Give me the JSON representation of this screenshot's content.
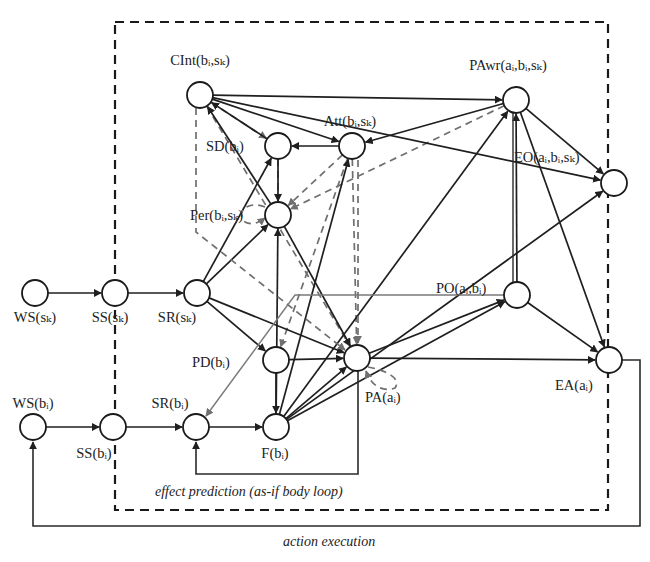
{
  "colors": {
    "edge_solid": "#1f1f1f",
    "edge_dashed": "#6f6f6f",
    "node_fill": "#ffffff",
    "node_stroke": "#1a1a1a",
    "background": "#ffffff"
  },
  "boundary": {
    "x": 115,
    "y": 22,
    "width": 493,
    "height": 488
  },
  "node_radius": 13,
  "nodes": [
    {
      "id": "WSs",
      "label": "WS(sₖ)",
      "x": 35,
      "y": 293,
      "lx": 35,
      "ly": 322,
      "anchor": "middle"
    },
    {
      "id": "SSs",
      "label": "SS(sₖ)",
      "x": 115,
      "y": 293,
      "lx": 110,
      "ly": 322,
      "anchor": "middle"
    },
    {
      "id": "SRs",
      "label": "SR(sₖ)",
      "x": 197,
      "y": 293,
      "lx": 177,
      "ly": 322,
      "anchor": "middle"
    },
    {
      "id": "CInt",
      "label": "CInt(bᵢ,sₖ)",
      "x": 200,
      "y": 95,
      "lx": 200,
      "ly": 65,
      "anchor": "middle"
    },
    {
      "id": "SD",
      "label": "SD(bᵢ)",
      "x": 278,
      "y": 146,
      "lx": 206,
      "ly": 151,
      "anchor": "start"
    },
    {
      "id": "Att",
      "label": "Att(bᵢ,sₖ)",
      "x": 352,
      "y": 146,
      "lx": 350,
      "ly": 126,
      "anchor": "middle"
    },
    {
      "id": "Per",
      "label": "Per(bᵢ,sₖ)",
      "x": 278,
      "y": 215,
      "lx": 190,
      "ly": 220,
      "anchor": "start"
    },
    {
      "id": "PAwr",
      "label": "PAwr(aᵢ,bᵢ,sₖ)",
      "x": 516,
      "y": 100,
      "lx": 508,
      "ly": 70,
      "anchor": "middle"
    },
    {
      "id": "EO",
      "label": "EO(aᵢ,bᵢ,sₖ)",
      "x": 614,
      "y": 183,
      "lx": 514,
      "ly": 162,
      "anchor": "start"
    },
    {
      "id": "PO",
      "label": "PO(aᵢ,bᵢ)",
      "x": 517,
      "y": 295,
      "lx": 436,
      "ly": 293,
      "anchor": "start"
    },
    {
      "id": "PD",
      "label": "PD(bᵢ)",
      "x": 276,
      "y": 360,
      "lx": 192,
      "ly": 367,
      "anchor": "start"
    },
    {
      "id": "PA",
      "label": "PA(aᵢ)",
      "x": 357,
      "y": 358,
      "lx": 365,
      "ly": 402,
      "anchor": "start"
    },
    {
      "id": "EA",
      "label": "EA(aᵢ)",
      "x": 609,
      "y": 360,
      "lx": 555,
      "ly": 390,
      "anchor": "start"
    },
    {
      "id": "WSb",
      "label": "WS(bᵢ)",
      "x": 33,
      "y": 427,
      "lx": 33,
      "ly": 408,
      "anchor": "middle"
    },
    {
      "id": "SSb",
      "label": "SS(bᵢ)",
      "x": 113,
      "y": 427,
      "lx": 94,
      "ly": 458,
      "anchor": "middle"
    },
    {
      "id": "SRb",
      "label": "SR(bᵢ)",
      "x": 196,
      "y": 427,
      "lx": 170,
      "ly": 408,
      "anchor": "middle"
    },
    {
      "id": "Fb",
      "label": "F(bᵢ)",
      "x": 276,
      "y": 427,
      "lx": 275,
      "ly": 458,
      "anchor": "middle"
    }
  ],
  "edges_solid": [
    [
      "WSs",
      "SSs"
    ],
    [
      "SSs",
      "SRs"
    ],
    [
      "WSb",
      "SSb"
    ],
    [
      "SSb",
      "SRb"
    ],
    [
      "SRb",
      "Fb"
    ],
    [
      "SRs",
      "SD"
    ],
    [
      "SRs",
      "Per"
    ],
    [
      "SRs",
      "PD"
    ],
    [
      "SRs",
      "PA"
    ],
    [
      "SD",
      "Per"
    ],
    [
      "Att",
      "SD"
    ],
    [
      "SD",
      "CInt"
    ],
    [
      "Per",
      "CInt"
    ],
    [
      "CInt",
      "PAwr"
    ],
    [
      "CInt",
      "Att"
    ],
    [
      "CInt",
      "EO"
    ],
    [
      "PAwr",
      "Att"
    ],
    [
      "PAwr",
      "EO"
    ],
    [
      "PAwr",
      "EA"
    ],
    [
      "PD",
      "Fb"
    ],
    [
      "PD",
      "PA"
    ],
    [
      "Fb",
      "Per"
    ],
    [
      "Fb",
      "Att"
    ],
    [
      "Fb",
      "PAwr"
    ],
    [
      "Fb",
      "PA"
    ],
    [
      "Fb",
      "PO"
    ],
    [
      "Fb",
      "EO"
    ],
    [
      "PA",
      "PO"
    ],
    [
      "PA",
      "EA"
    ],
    [
      "PO",
      "EA"
    ],
    [
      "PO",
      "PAwr"
    ],
    [
      "Per",
      "PA"
    ]
  ],
  "edges_dashed": [
    [
      "CInt",
      "SD"
    ],
    [
      "Att",
      "Per"
    ],
    [
      "PAwr",
      "Per"
    ],
    [
      "SD",
      "Per"
    ],
    [
      "Att",
      "PA"
    ],
    [
      "CInt",
      "PA"
    ],
    [
      "Att",
      "PD"
    ]
  ],
  "captions": {
    "effect_prediction": "effect prediction (as-if body loop)",
    "action_execution": "action execution"
  }
}
